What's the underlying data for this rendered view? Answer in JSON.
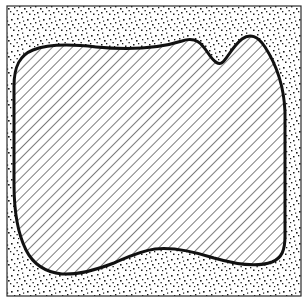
{
  "figure": {
    "type": "diagram",
    "canvas": {
      "width": 308,
      "height": 305,
      "background": "#ffffff"
    },
    "frame": {
      "name": "outer-frame",
      "x": 7,
      "y": 6,
      "width": 294,
      "height": 290,
      "stroke": "#2b2b2b",
      "stroke_width": 1.2,
      "fill": "none"
    },
    "layers": [
      {
        "name": "stipple-background",
        "pattern": "random-dot-stipple",
        "color": "#1a1a1a",
        "density": "medium"
      },
      {
        "name": "hatched-region",
        "pattern": "diagonal-hatch",
        "color": "#1a1a1a",
        "angle_deg": 45,
        "spacing_px": 7
      }
    ],
    "region": {
      "name": "hatched-region",
      "outline_color": "#111111",
      "outline_width": 3.0,
      "fill_pattern": "diagonal-hatch",
      "path": "M 14,86 C 14,66 20,55 33,50 C 48,44 70,44 96,47 C 128,50 160,48 182,41 C 196,36 202,44 208,53 C 214,62 219,66 223,62 C 228,57 233,46 242,39 C 250,33 258,36 265,47 C 276,64 284,86 285,112 L 285,236 C 285,250 282,258 272,262 C 258,267 238,265 214,258 C 192,251 172,247 155,249 C 140,251 128,257 114,263 C 96,270 78,275 62,274 C 44,272 33,264 26,250 C 18,234 14,210 14,184 Z",
      "features": [
        {
          "name": "top-left-rounded-corner",
          "approx_xy": [
            22,
            58
          ]
        },
        {
          "name": "top-left-hump-crest",
          "approx_xy": [
            130,
            45
          ]
        },
        {
          "name": "left-hump-crest",
          "approx_xy": [
            200,
            48
          ]
        },
        {
          "name": "v-notch-vertex",
          "approx_xy": [
            222,
            62
          ]
        },
        {
          "name": "right-hump-crest",
          "approx_xy": [
            252,
            37
          ]
        },
        {
          "name": "right-edge-max",
          "approx_xy": [
            285,
            150
          ]
        },
        {
          "name": "bottom-right-corner",
          "approx_xy": [
            272,
            261
          ]
        },
        {
          "name": "bottom-trough",
          "approx_xy": [
            62,
            274
          ]
        },
        {
          "name": "left-edge-min",
          "approx_xy": [
            14,
            150
          ]
        }
      ]
    },
    "legend_visible": false,
    "axis_visible": false,
    "labels_visible": false
  }
}
